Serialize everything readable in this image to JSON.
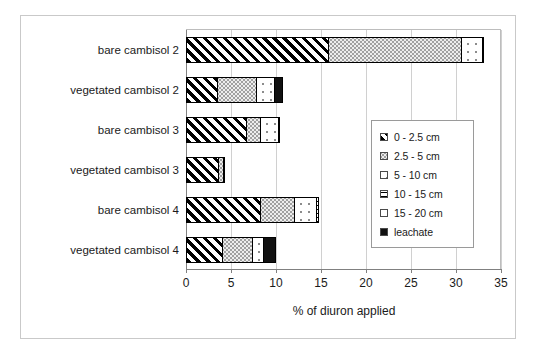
{
  "chart_data": {
    "type": "bar",
    "orientation": "horizontal",
    "stacked": true,
    "title": "",
    "xlabel": "% of diuron applied",
    "ylabel": "",
    "xlim": [
      0,
      35
    ],
    "xticks": [
      0,
      5,
      10,
      15,
      20,
      25,
      30,
      35
    ],
    "xtick_labels": [
      "0",
      "5",
      "10",
      "15",
      "20",
      "25",
      "30",
      "35"
    ],
    "grid": "vertical",
    "legend_position": "center-right",
    "categories": [
      "bare cambisol 2",
      "vegetated cambisol 2",
      "bare cambisol 3",
      "vegetated cambisol 3",
      "bare cambisol 4",
      "vegetated cambisol 4"
    ],
    "series": [
      {
        "name": "0 - 2.5 cm",
        "pattern": "diagonal-hatch",
        "values": [
          15.8,
          3.4,
          6.7,
          3.6,
          8.2,
          4.0
        ]
      },
      {
        "name": "2.5 - 5 cm",
        "pattern": "dense-dot",
        "values": [
          14.8,
          4.4,
          1.5,
          0.6,
          3.8,
          3.3
        ]
      },
      {
        "name": "5 - 10 cm",
        "pattern": "sparse-dot",
        "values": [
          2.3,
          2.0,
          2.0,
          0.0,
          2.5,
          1.3
        ]
      },
      {
        "name": "10 - 15 cm",
        "pattern": "horizontal-lines",
        "values": [
          0.0,
          0.0,
          0.0,
          0.0,
          0.3,
          0.0
        ]
      },
      {
        "name": "15 - 20 cm",
        "pattern": "plain",
        "values": [
          0.0,
          0.0,
          0.0,
          0.0,
          0.0,
          0.0
        ]
      },
      {
        "name": "leachate",
        "pattern": "solid-black",
        "values": [
          0.2,
          1.0,
          0.2,
          0.15,
          0.0,
          1.4
        ]
      }
    ],
    "totals": [
      33.1,
      10.8,
      10.4,
      4.35,
      14.8,
      10.0
    ]
  },
  "legend": {
    "items": [
      {
        "label": "0 - 2.5 cm"
      },
      {
        "label": "2.5 - 5 cm"
      },
      {
        "label": "5 - 10 cm"
      },
      {
        "label": "10 - 15 cm"
      },
      {
        "label": "15 - 20 cm"
      },
      {
        "label": "leachate"
      }
    ]
  },
  "axis": {
    "x_title": "% of diuron applied"
  }
}
